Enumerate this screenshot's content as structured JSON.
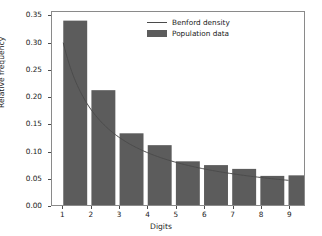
{
  "chart_data": {
    "type": "bar",
    "title": "",
    "xlabel": "Digits",
    "ylabel": "Relative frequency",
    "categories": [
      "1",
      "2",
      "3",
      "4",
      "5",
      "6",
      "7",
      "8",
      "9"
    ],
    "xlim": [
      0.6,
      9.55
    ],
    "ylim": [
      0.0,
      0.358
    ],
    "grid": false,
    "legend_position": "upper center",
    "bar_color": "#5c5c5c",
    "line_color": "#4b4b4b",
    "axes_color": "#8a8a8a",
    "background_color": "#ffffff",
    "xticks": [
      "1",
      "2",
      "3",
      "4",
      "5",
      "6",
      "7",
      "8",
      "9"
    ],
    "yticks": [
      "0.00",
      "0.05",
      "0.10",
      "0.15",
      "0.20",
      "0.25",
      "0.30",
      "0.35"
    ],
    "ytick_values": [
      0.0,
      0.05,
      0.1,
      0.15,
      0.2,
      0.25,
      0.3,
      0.35
    ],
    "xtick_values": [
      1,
      2,
      3,
      4,
      5,
      6,
      7,
      8,
      9
    ],
    "series": [
      {
        "name": "Population data",
        "kind": "bar",
        "bar_width": 0.85,
        "values": [
          0.342,
          0.213,
          0.133,
          0.111,
          0.081,
          0.074,
          0.067,
          0.054,
          0.055
        ]
      },
      {
        "name": "Benford density",
        "kind": "line",
        "x": [
          1,
          2,
          3,
          4,
          5,
          6,
          7,
          8,
          9
        ],
        "values": [
          0.301,
          0.176,
          0.125,
          0.097,
          0.079,
          0.067,
          0.058,
          0.051,
          0.046
        ]
      }
    ]
  },
  "legend": {
    "entries": [
      {
        "label": "Benford density",
        "key": "line"
      },
      {
        "label": "Population data",
        "key": "patch"
      }
    ]
  },
  "axis": {
    "xlabel": "Digits",
    "ylabel": "Relative frequency"
  }
}
